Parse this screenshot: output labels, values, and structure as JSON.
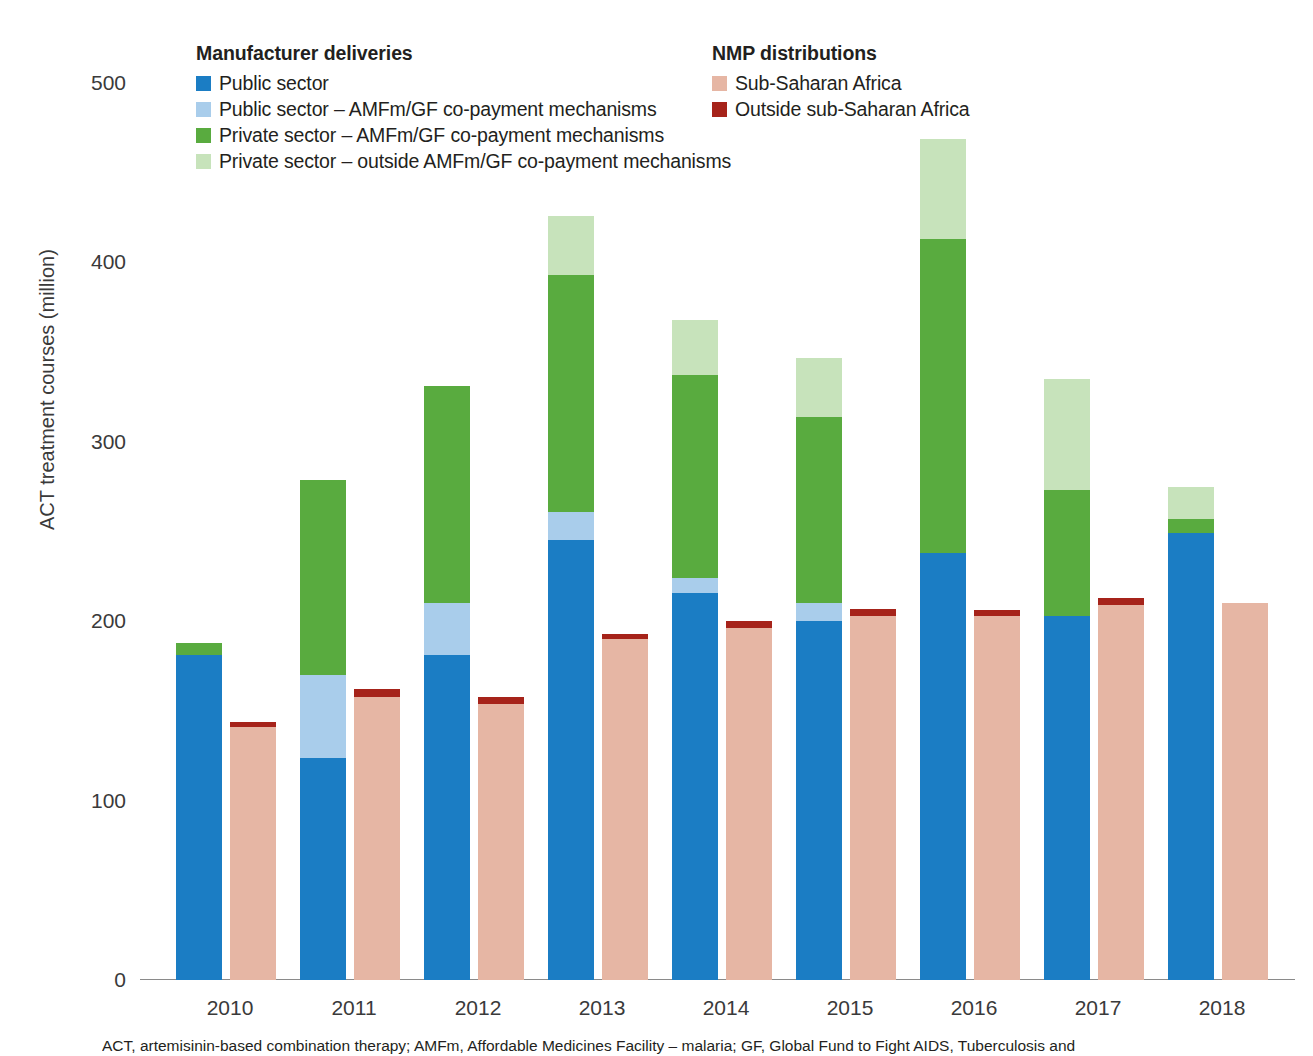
{
  "chart_data": {
    "type": "bar",
    "stacked": true,
    "grouped": true,
    "title": "",
    "xlabel": "",
    "ylabel": "ACT treatment courses (million)",
    "ylim": [
      0,
      500
    ],
    "yticks": [
      0,
      100,
      200,
      300,
      400,
      500
    ],
    "ytick_labels": [
      "0",
      "100",
      "200",
      "300",
      "400",
      "500"
    ],
    "grid": false,
    "legend_position": "top",
    "categories": [
      "2010",
      "2011",
      "2012",
      "2013",
      "2014",
      "2015",
      "2016",
      "2017",
      "2018"
    ],
    "groups": [
      {
        "name": "Manufacturer deliveries",
        "bar_index": 0,
        "series": [
          {
            "name": "Public sector",
            "color": "#1b7dc4",
            "values": [
              181,
              124,
              181,
              245,
              216,
              200,
              238,
              203,
              249
            ]
          },
          {
            "name": "Public sector – AMFm/GF co-payment mechanisms",
            "color": "#a9cdeb",
            "values": [
              0,
              46,
              29,
              16,
              8,
              10,
              0,
              0,
              0
            ]
          },
          {
            "name": "Private sector – AMFm/GF co-payment mechanisms",
            "color": "#59ab3f",
            "values": [
              7,
              109,
              121,
              132,
              113,
              104,
              175,
              70,
              8
            ]
          },
          {
            "name": "Private sector – outside AMFm/GF co-payment mechanisms",
            "color": "#c7e3bb",
            "values": [
              0,
              0,
              0,
              33,
              31,
              33,
              56,
              62,
              18
            ]
          }
        ]
      },
      {
        "name": "NMP distributions",
        "bar_index": 1,
        "series": [
          {
            "name": "Sub-Saharan Africa",
            "color": "#e6b6a4",
            "values": [
              141,
              158,
              154,
              190,
              196,
              203,
              203,
              209,
              210
            ]
          },
          {
            "name": "Outside sub-Saharan Africa",
            "color": "#a6231a",
            "values": [
              3,
              4,
              4,
              3,
              4,
              4,
              3,
              4,
              0
            ]
          }
        ]
      }
    ],
    "annotations": []
  },
  "legend": {
    "left": {
      "title": "Manufacturer deliveries",
      "items": [
        {
          "label": "Public sector",
          "color": "#1b7dc4"
        },
        {
          "label": "Public sector – AMFm/GF co-payment mechanisms",
          "color": "#a9cdeb"
        },
        {
          "label": "Private sector – AMFm/GF co-payment mechanisms",
          "color": "#59ab3f"
        },
        {
          "label": "Private sector – outside AMFm/GF co-payment mechanisms",
          "color": "#c7e3bb"
        }
      ]
    },
    "right": {
      "title": "NMP distributions",
      "items": [
        {
          "label": "Sub-Saharan Africa",
          "color": "#e6b6a4"
        },
        {
          "label": "Outside sub-Saharan Africa",
          "color": "#a6231a"
        }
      ]
    }
  },
  "axes": {
    "y_title": "ACT treatment courses (million)"
  },
  "footnote": {
    "text": "ACT, artemisinin-based combination therapy; AMFm, Affordable Medicines Facility – malaria; GF, Global Fund to Fight AIDS, Tuberculosis and"
  }
}
